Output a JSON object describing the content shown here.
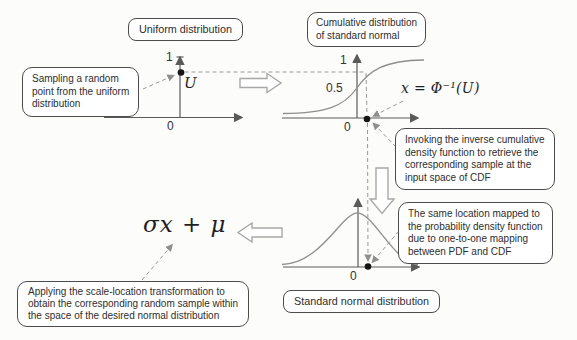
{
  "boxes": {
    "uniform": {
      "label": "Uniform distribution"
    },
    "std_normal": {
      "label": "Standard normal distribution"
    },
    "cdf": {
      "lines": [
        "Cumulative distribution",
        "of standard normal"
      ]
    },
    "sampling": {
      "lines": [
        "Sampling a random",
        "point from the uniform",
        "distribution"
      ]
    },
    "invoking": {
      "lines": [
        "Invoking the inverse cumulative",
        "density function to retrieve the",
        "corresponding sample at the",
        "input space of CDF"
      ]
    },
    "same_location": {
      "lines": [
        "The same location mapped to",
        "the probability density function",
        "due to one-to-one mapping",
        "between PDF and CDF"
      ]
    },
    "applying": {
      "lines": [
        "Applying the scale-location transformation to",
        "obtain the corresponding random sample within",
        "the space of the desired normal distribution"
      ]
    }
  },
  "formulas": {
    "u_sample": "U",
    "inverse_cdf": "x = Φ⁻¹(U)",
    "scale_location": "σx + μ"
  },
  "axes": {
    "uniform": {
      "one": "1",
      "zero": "0"
    },
    "cdf": {
      "one": "1",
      "half": "0.5",
      "zero": "0"
    },
    "pdf": {
      "zero": "0"
    }
  },
  "icons": {
    "flow_right": "right-block-arrow",
    "flow_down": "down-block-arrow",
    "flow_left": "left-block-arrow"
  },
  "colors": {
    "background": "#fcfcfb",
    "box_border": "#4c4c4c",
    "axis": "#5a5a5a",
    "curve": "#8e8e8e",
    "dashed": "#999999",
    "dot": "#161616",
    "block_arrow_outline": "#a8a8a8"
  }
}
